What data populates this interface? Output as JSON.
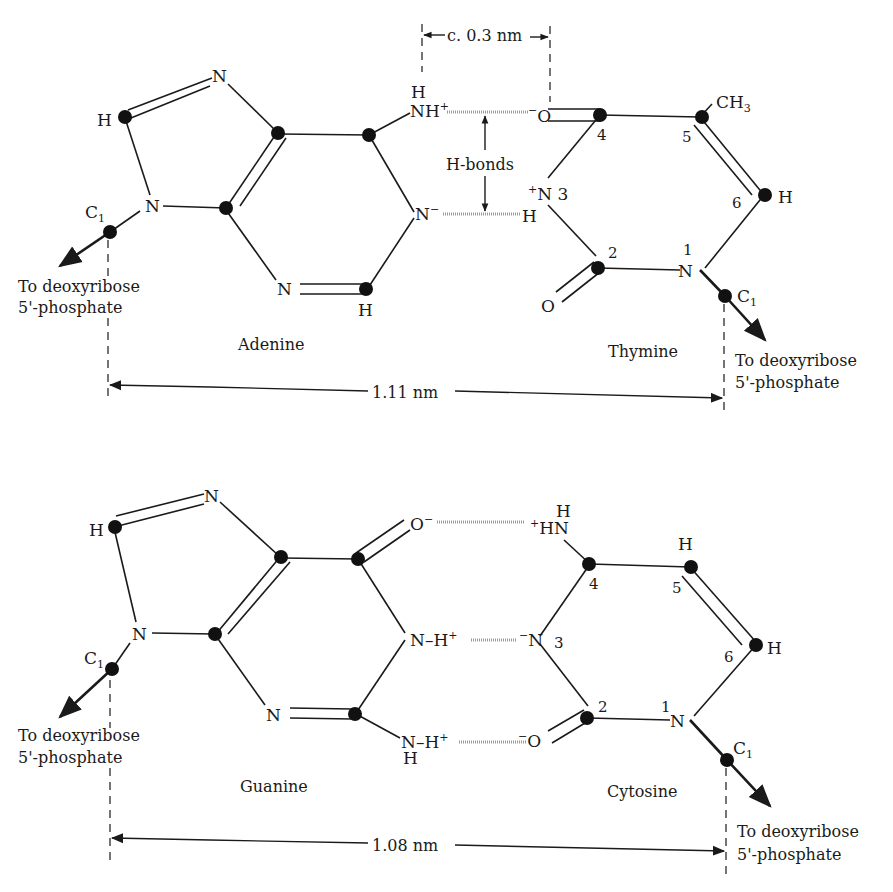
{
  "top_pair": {
    "left_base": "Adenine",
    "right_base": "Thymine",
    "distance_c1_c1": "1.11 nm",
    "hbond_distance": "c. 0.3 nm",
    "hbond_label": "H-bonds",
    "adenine_atoms": {
      "n7": "N",
      "c8_h": "H",
      "n9": "N",
      "c1": "C",
      "c1_sub": "1",
      "n6_h": "H",
      "n6": "NH",
      "n6_charge": "+",
      "n1": "N",
      "n1_charge": "−",
      "n3": "N",
      "c2_h": "H"
    },
    "thymine_atoms": {
      "o4_charge": "−",
      "o4": "O",
      "ch3": "CH",
      "ch3_sub": "3",
      "n3_charge": "+",
      "n3": "N 3",
      "h3": "H",
      "c6_h": "H",
      "n1_num": "1",
      "n1": "N",
      "o2": "O",
      "c1": "C",
      "c1_sub": "1",
      "pos4": "4",
      "pos5": "5",
      "pos6": "6",
      "pos2": "2"
    },
    "left_sugar_label": [
      "To deoxyribose",
      "5'-phosphate"
    ],
    "right_sugar_label": [
      "To deoxyribose",
      "5'-phosphate"
    ]
  },
  "bottom_pair": {
    "left_base": "Guanine",
    "right_base": "Cytosine",
    "distance_c1_c1": "1.08 nm",
    "guanine_atoms": {
      "n7": "N",
      "c8_h": "H",
      "n9": "N",
      "c1": "C",
      "c1_sub": "1",
      "o6": "O",
      "o6_charge": "−",
      "n1": "N–H",
      "n1_charge": "+",
      "n3": "N",
      "n2": "N–H",
      "n2_charge": "+",
      "n2_h": "H"
    },
    "cytosine_atoms": {
      "n4_h": "H",
      "n4": "HN",
      "n4_charge": "+",
      "c5_h": "H",
      "c6_h": "H",
      "n3_charge": "−",
      "n3": "N",
      "n3_num": "3",
      "o2_charge": "−",
      "o2": "O",
      "n1_num": "1",
      "n1": "N",
      "c1": "C",
      "c1_sub": "1",
      "pos4": "4",
      "pos5": "5",
      "pos6": "6",
      "pos2": "2"
    },
    "left_sugar_label": [
      "To deoxyribose",
      "5'-phosphate"
    ],
    "right_sugar_label": [
      "To deoxyribose",
      "5'-phosphate"
    ]
  }
}
